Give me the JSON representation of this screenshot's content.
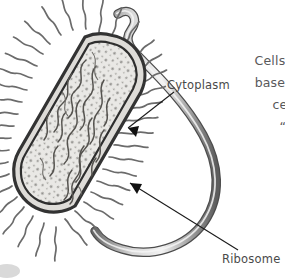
{
  "figure": {
    "background_color": "#ffffff"
  },
  "labels": {
    "cytoplasm": "Cytoplasm",
    "ribosome": "Ribosome"
  },
  "body_text": {
    "line1": "Cells",
    "line2": "based",
    "line3": "ce",
    "line4": "“,"
  },
  "colors": {
    "outline": "#3a3a3a",
    "cell_wall": "#4b4b4b",
    "cytoplasm_fill": "#e8e7e4",
    "pili": "#6e6e6e",
    "flagellum_dark": "#5f5f5f",
    "flagellum_light": "#cfcfcf",
    "text": "#59595b",
    "label_text": "#4a4a4a",
    "leader_line": "#1c1c1c"
  },
  "parts": {
    "flagellum": "flagellum",
    "pili": "pili-fringe",
    "cell_wall": "cell-wall",
    "plasma_membrane": "plasma-membrane",
    "cytoplasm": "cytoplasm",
    "nucleoid_dna": "nucleoid-dna-strands",
    "ribosomes": "ribosome-granules"
  }
}
